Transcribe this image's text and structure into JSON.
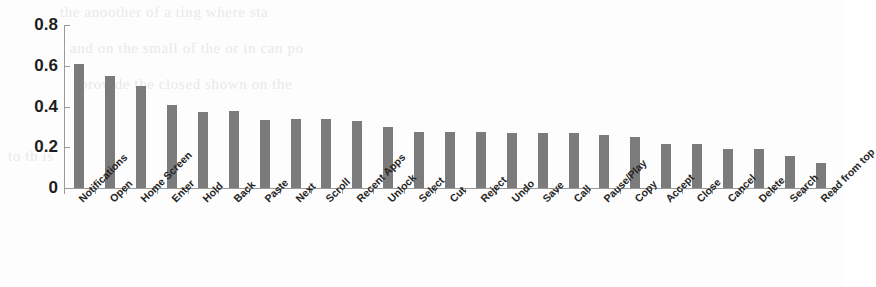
{
  "chart_data": {
    "type": "bar",
    "title": "",
    "subtitle": "",
    "xlabel": "",
    "ylabel": "",
    "ylim": [
      0,
      0.8
    ],
    "ytick_labels": [
      "0",
      "0.2",
      "0.4",
      "0.6",
      "0.8"
    ],
    "ytick_values": [
      0,
      0.2,
      0.4,
      0.6,
      0.8
    ],
    "grid": false,
    "legend": null,
    "bar_color": "#7b7b7b",
    "axis_color": "#9a9a9a",
    "categories": [
      "Notifications",
      "Open",
      "Home Screen",
      "Enter",
      "Hold",
      "Back",
      "Paste",
      "Next",
      "Scroll",
      "Recent Apps",
      "Unlock",
      "Select",
      "Cut",
      "Reject",
      "Undo",
      "Save",
      "Call",
      "Pause/Play",
      "Copy",
      "Accept",
      "Close",
      "Cancel",
      "Delete",
      "Search",
      "Read from top"
    ],
    "values": [
      0.61,
      0.55,
      0.5,
      0.405,
      0.375,
      0.378,
      0.335,
      0.338,
      0.337,
      0.33,
      0.3,
      0.275,
      0.275,
      0.275,
      0.272,
      0.268,
      0.268,
      0.262,
      0.25,
      0.218,
      0.218,
      0.19,
      0.19,
      0.155,
      0.125
    ]
  },
  "bleed_text": [
    "the  anoother  of  a  ting  where  sta",
    "and  on  the  small  of  the  or  in  can  po",
    "provide  the  closed  shown  on  the",
    "to  th  is"
  ]
}
